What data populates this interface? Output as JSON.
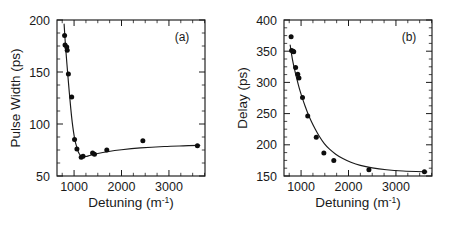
{
  "figure": {
    "background": "#ffffff",
    "ink_color": "#1a1a1a",
    "marker_color": "#0d0d0d"
  },
  "chart_data": [
    {
      "type": "scatter",
      "panel_label": "(a)",
      "title": "",
      "xlabel": "Detuning (m",
      "xlabel_sup": "-1",
      "xlabel_tail": ")",
      "ylabel": "Pulse Width (ps)",
      "xlim": [
        640,
        3760
      ],
      "ylim": [
        50,
        200
      ],
      "xticks": [
        1000,
        2000,
        3000
      ],
      "xticklabels": [
        "1000",
        "2000",
        "3000"
      ],
      "yticks": [
        50,
        100,
        150,
        200
      ],
      "yticklabels": [
        "50",
        "100",
        "150",
        "200"
      ],
      "x_minor_interval": 250,
      "y_minor_interval": 12.5,
      "grid": false,
      "legend": null,
      "points": [
        {
          "x": 800,
          "y": 185
        },
        {
          "x": 810,
          "y": 176
        },
        {
          "x": 845,
          "y": 174
        },
        {
          "x": 855,
          "y": 171
        },
        {
          "x": 880,
          "y": 148
        },
        {
          "x": 950,
          "y": 126
        },
        {
          "x": 1010,
          "y": 85
        },
        {
          "x": 1060,
          "y": 76
        },
        {
          "x": 1150,
          "y": 68
        },
        {
          "x": 1190,
          "y": 69
        },
        {
          "x": 1390,
          "y": 72
        },
        {
          "x": 1430,
          "y": 71
        },
        {
          "x": 1690,
          "y": 75
        },
        {
          "x": 2450,
          "y": 84
        },
        {
          "x": 3600,
          "y": 79
        }
      ],
      "fit_curve": [
        {
          "x": 790,
          "y": 196
        },
        {
          "x": 812,
          "y": 180
        },
        {
          "x": 840,
          "y": 163
        },
        {
          "x": 870,
          "y": 146
        },
        {
          "x": 900,
          "y": 130
        },
        {
          "x": 930,
          "y": 115
        },
        {
          "x": 960,
          "y": 102
        },
        {
          "x": 990,
          "y": 92
        },
        {
          "x": 1020,
          "y": 84
        },
        {
          "x": 1055,
          "y": 78
        },
        {
          "x": 1090,
          "y": 73
        },
        {
          "x": 1130,
          "y": 70
        },
        {
          "x": 1180,
          "y": 68.5
        },
        {
          "x": 1250,
          "y": 68.8
        },
        {
          "x": 1350,
          "y": 70
        },
        {
          "x": 1500,
          "y": 71.6
        },
        {
          "x": 1700,
          "y": 73.3
        },
        {
          "x": 2000,
          "y": 75.2
        },
        {
          "x": 2400,
          "y": 77
        },
        {
          "x": 2900,
          "y": 78.4
        },
        {
          "x": 3300,
          "y": 79
        },
        {
          "x": 3650,
          "y": 79.4
        }
      ]
    },
    {
      "type": "scatter",
      "panel_label": "(b)",
      "title": "",
      "xlabel": "Detuning (m",
      "xlabel_sup": "-1",
      "xlabel_tail": ")",
      "ylabel": "Delay (ps)",
      "xlim": [
        640,
        3760
      ],
      "ylim": [
        150,
        400
      ],
      "xticks": [
        1000,
        2000,
        3000
      ],
      "xticklabels": [
        "1000",
        "2000",
        "3000"
      ],
      "yticks": [
        150,
        200,
        250,
        300,
        350,
        400
      ],
      "yticklabels": [
        "150",
        "200",
        "250",
        "300",
        "350",
        "400"
      ],
      "x_minor_interval": 250,
      "y_minor_interval": 12.5,
      "grid": false,
      "legend": null,
      "points": [
        {
          "x": 790,
          "y": 373
        },
        {
          "x": 800,
          "y": 351
        },
        {
          "x": 830,
          "y": 350
        },
        {
          "x": 845,
          "y": 349
        },
        {
          "x": 885,
          "y": 324
        },
        {
          "x": 930,
          "y": 313
        },
        {
          "x": 955,
          "y": 307
        },
        {
          "x": 1030,
          "y": 276
        },
        {
          "x": 1140,
          "y": 246
        },
        {
          "x": 1320,
          "y": 212
        },
        {
          "x": 1480,
          "y": 187
        },
        {
          "x": 1690,
          "y": 175
        },
        {
          "x": 2430,
          "y": 160
        },
        {
          "x": 3600,
          "y": 157
        }
      ],
      "fit_curve": [
        {
          "x": 770,
          "y": 360
        },
        {
          "x": 800,
          "y": 345
        },
        {
          "x": 830,
          "y": 332
        },
        {
          "x": 865,
          "y": 320
        },
        {
          "x": 900,
          "y": 309
        },
        {
          "x": 940,
          "y": 297
        },
        {
          "x": 980,
          "y": 286
        },
        {
          "x": 1030,
          "y": 274
        },
        {
          "x": 1090,
          "y": 261
        },
        {
          "x": 1150,
          "y": 249
        },
        {
          "x": 1220,
          "y": 237
        },
        {
          "x": 1300,
          "y": 225
        },
        {
          "x": 1390,
          "y": 213
        },
        {
          "x": 1490,
          "y": 202
        },
        {
          "x": 1600,
          "y": 193
        },
        {
          "x": 1730,
          "y": 185
        },
        {
          "x": 1880,
          "y": 178
        },
        {
          "x": 2050,
          "y": 172
        },
        {
          "x": 2250,
          "y": 167
        },
        {
          "x": 2500,
          "y": 163
        },
        {
          "x": 2800,
          "y": 160
        },
        {
          "x": 3150,
          "y": 158
        },
        {
          "x": 3650,
          "y": 156.5
        }
      ]
    }
  ]
}
